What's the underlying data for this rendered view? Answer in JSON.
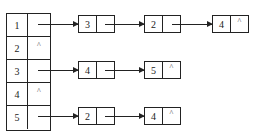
{
  "diagram": {
    "type": "adjacency-list",
    "head_table": {
      "rows": [
        {
          "vertex": "1",
          "pointer": ""
        },
        {
          "vertex": "2",
          "pointer": "^"
        },
        {
          "vertex": "3",
          "pointer": ""
        },
        {
          "vertex": "4",
          "pointer": "^"
        },
        {
          "vertex": "5",
          "pointer": ""
        }
      ]
    },
    "lists": [
      {
        "head": "1",
        "nodes": [
          {
            "value": "3",
            "next": ""
          },
          {
            "value": "2",
            "next": ""
          },
          {
            "value": "4",
            "next": "^"
          }
        ]
      },
      {
        "head": "3",
        "nodes": [
          {
            "value": "4",
            "next": ""
          },
          {
            "value": "5",
            "next": "^"
          }
        ]
      },
      {
        "head": "5",
        "nodes": [
          {
            "value": "2",
            "next": ""
          },
          {
            "value": "4",
            "next": "^"
          }
        ]
      }
    ],
    "null_symbol": "^",
    "line_color": "#222222"
  }
}
